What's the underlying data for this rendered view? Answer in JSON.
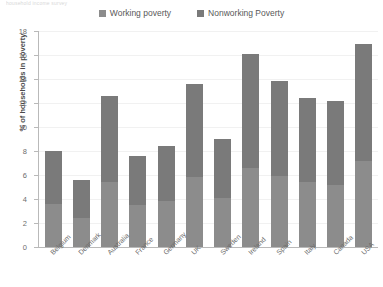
{
  "top_caption": "household income survey",
  "legend": {
    "position": "top-center",
    "items": [
      {
        "label": "Working poverty",
        "color": "#8c8c8c",
        "icon": "legend-swatch-icon"
      },
      {
        "label": "Nonworking Poverty",
        "color": "#7a7a7a",
        "icon": "legend-swatch-icon"
      }
    ]
  },
  "axes": {
    "ylabel": "% of households in poverty",
    "yticks": [
      "0",
      "2",
      "4",
      "6",
      "8",
      "10",
      "12",
      "14",
      "16",
      "18"
    ],
    "xlabel": ""
  },
  "chart_data": {
    "type": "bar",
    "title": "",
    "subtitle": "",
    "xlabel": "",
    "ylabel": "% of households in poverty",
    "ylim": [
      0,
      18
    ],
    "ytick_values": [
      0,
      2,
      4,
      6,
      8,
      10,
      12,
      14,
      16,
      18
    ],
    "grid": true,
    "stacked": true,
    "legend_position": "top-center",
    "categories": [
      "Belgium",
      "Denmark",
      "Australia",
      "France",
      "Germany",
      "UK",
      "Sweden",
      "Ireland",
      "Spain",
      "Italy",
      "Canada",
      "USA"
    ],
    "series": [
      {
        "name": "Working poverty",
        "color": "#8c8c8c",
        "values": [
          3.6,
          2.4,
          5.4,
          3.5,
          3.8,
          5.8,
          4.1,
          6.6,
          5.9,
          5.4,
          5.2,
          7.2
        ]
      },
      {
        "name": "Nonworking Poverty",
        "color": "#7a7a7a",
        "values": [
          4.4,
          3.2,
          7.2,
          4.1,
          4.6,
          7.8,
          4.9,
          9.5,
          7.9,
          7.0,
          7.0,
          9.7
        ]
      }
    ],
    "totals": [
      8.0,
      5.6,
      12.6,
      7.6,
      8.4,
      13.6,
      9.0,
      16.1,
      13.8,
      12.4,
      12.2,
      16.9
    ]
  },
  "colors": {
    "working": "#8c8c8c",
    "nonworking": "#7a7a7a",
    "axis": "#b9b9b9",
    "grid": "#f1f1f1",
    "text": "#6b6b6b"
  }
}
